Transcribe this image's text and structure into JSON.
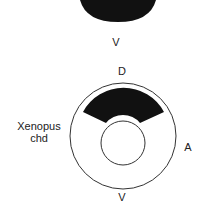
{
  "top_embryo": {
    "label_bottom": "V"
  },
  "bottom_embryo": {
    "label_top": "D",
    "label_bottom": "V",
    "label_right": "A",
    "label_left_line1": "Xenopus",
    "label_left_line2": "chd"
  },
  "colors": {
    "stain": "#111111",
    "outline": "#333333",
    "background": "#ffffff"
  }
}
